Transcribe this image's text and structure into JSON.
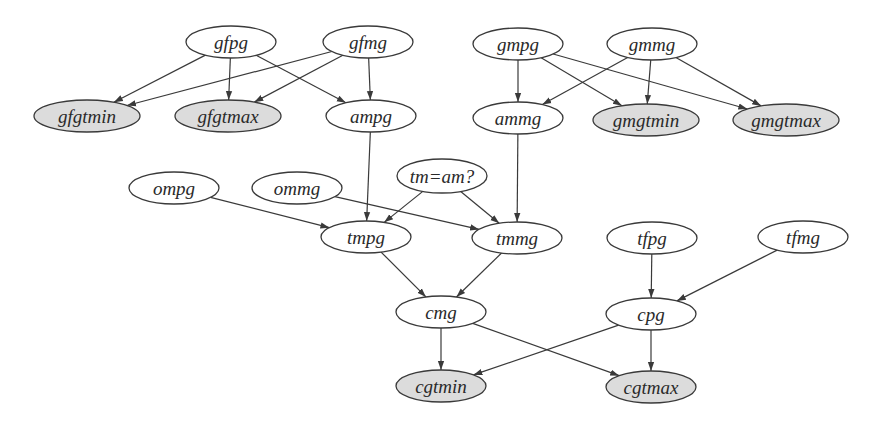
{
  "colors": {
    "background": "#ffffff",
    "stroke": "#3a3a3a",
    "plain_fill": "#ffffff",
    "highlight_fill": "#dcdcdc"
  },
  "nodes": [
    {
      "id": "gfpg",
      "label": "gfpg",
      "x": 231,
      "y": 42,
      "rx": 45,
      "ry": 16,
      "shaded": false
    },
    {
      "id": "gfmg",
      "label": "gfmg",
      "x": 368,
      "y": 42,
      "rx": 45,
      "ry": 16,
      "shaded": false
    },
    {
      "id": "gmpg",
      "label": "gmpg",
      "x": 518,
      "y": 44,
      "rx": 45,
      "ry": 16,
      "shaded": false
    },
    {
      "id": "gmmg",
      "label": "gmmg",
      "x": 652,
      "y": 44,
      "rx": 45,
      "ry": 16,
      "shaded": false
    },
    {
      "id": "gfgtmin",
      "label": "gfgtmin",
      "x": 87,
      "y": 116,
      "rx": 53,
      "ry": 16,
      "shaded": true
    },
    {
      "id": "gfgtmax",
      "label": "gfgtmax",
      "x": 228,
      "y": 116,
      "rx": 53,
      "ry": 16,
      "shaded": true
    },
    {
      "id": "ampg",
      "label": "ampg",
      "x": 371,
      "y": 116,
      "rx": 45,
      "ry": 16,
      "shaded": false
    },
    {
      "id": "ammg",
      "label": "ammg",
      "x": 518,
      "y": 118,
      "rx": 45,
      "ry": 16,
      "shaded": false
    },
    {
      "id": "gmgtmin",
      "label": "gmgtmin",
      "x": 646,
      "y": 120,
      "rx": 53,
      "ry": 16,
      "shaded": true
    },
    {
      "id": "gmgtmax",
      "label": "gmgtmax",
      "x": 786,
      "y": 120,
      "rx": 53,
      "ry": 16,
      "shaded": true
    },
    {
      "id": "ompg",
      "label": "ompg",
      "x": 174,
      "y": 188,
      "rx": 45,
      "ry": 16,
      "shaded": false
    },
    {
      "id": "ommg",
      "label": "ommg",
      "x": 297,
      "y": 188,
      "rx": 45,
      "ry": 16,
      "shaded": false
    },
    {
      "id": "tmam",
      "label": "tm=am?",
      "x": 442,
      "y": 176,
      "rx": 45,
      "ry": 17,
      "shaded": false
    },
    {
      "id": "tmpg",
      "label": "tmpg",
      "x": 366,
      "y": 237,
      "rx": 45,
      "ry": 16,
      "shaded": false
    },
    {
      "id": "tmmg",
      "label": "tmmg",
      "x": 517,
      "y": 238,
      "rx": 45,
      "ry": 16,
      "shaded": false
    },
    {
      "id": "tfpg",
      "label": "tfpg",
      "x": 652,
      "y": 238,
      "rx": 45,
      "ry": 16,
      "shaded": false
    },
    {
      "id": "tfmg",
      "label": "tfmg",
      "x": 803,
      "y": 237,
      "rx": 45,
      "ry": 16,
      "shaded": false
    },
    {
      "id": "cmg",
      "label": "cmg",
      "x": 441,
      "y": 312,
      "rx": 45,
      "ry": 16,
      "shaded": false
    },
    {
      "id": "cpg",
      "label": "cpg",
      "x": 651,
      "y": 314,
      "rx": 45,
      "ry": 16,
      "shaded": false
    },
    {
      "id": "cgtmin",
      "label": "cgtmin",
      "x": 441,
      "y": 386,
      "rx": 45,
      "ry": 16,
      "shaded": true
    },
    {
      "id": "cgtmax",
      "label": "cgtmax",
      "x": 651,
      "y": 387,
      "rx": 45,
      "ry": 16,
      "shaded": true
    }
  ],
  "edges": [
    {
      "from": "gfpg",
      "to": "gfgtmin"
    },
    {
      "from": "gfpg",
      "to": "gfgtmax"
    },
    {
      "from": "gfpg",
      "to": "ampg"
    },
    {
      "from": "gfmg",
      "to": "gfgtmin"
    },
    {
      "from": "gfmg",
      "to": "gfgtmax"
    },
    {
      "from": "gfmg",
      "to": "ampg"
    },
    {
      "from": "gmpg",
      "to": "ammg"
    },
    {
      "from": "gmpg",
      "to": "gmgtmin"
    },
    {
      "from": "gmpg",
      "to": "gmgtmax"
    },
    {
      "from": "gmmg",
      "to": "ammg"
    },
    {
      "from": "gmmg",
      "to": "gmgtmin"
    },
    {
      "from": "gmmg",
      "to": "gmgtmax"
    },
    {
      "from": "ampg",
      "to": "tmpg"
    },
    {
      "from": "ammg",
      "to": "tmmg"
    },
    {
      "from": "ompg",
      "to": "tmpg"
    },
    {
      "from": "ommg",
      "to": "tmmg"
    },
    {
      "from": "tmam",
      "to": "tmpg"
    },
    {
      "from": "tmam",
      "to": "tmmg"
    },
    {
      "from": "tmpg",
      "to": "cmg"
    },
    {
      "from": "tmmg",
      "to": "cmg"
    },
    {
      "from": "tfpg",
      "to": "cpg"
    },
    {
      "from": "tfmg",
      "to": "cpg"
    },
    {
      "from": "cmg",
      "to": "cgtmin"
    },
    {
      "from": "cmg",
      "to": "cgtmax"
    },
    {
      "from": "cpg",
      "to": "cgtmin"
    },
    {
      "from": "cpg",
      "to": "cgtmax"
    }
  ]
}
